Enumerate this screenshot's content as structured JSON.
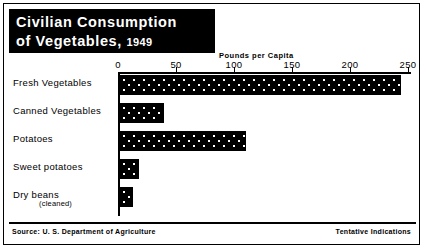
{
  "title": {
    "line1": "Civilian Consumption",
    "line2_text": "of  Vegetables,",
    "line2_year": "1949"
  },
  "footer": {
    "source": "Source: U. S. Department of Agriculture",
    "note": "Tentative Indications"
  },
  "chart_data": {
    "type": "bar",
    "orientation": "horizontal",
    "title": "Civilian Consumption of Vegetables, 1949",
    "xlabel": "Pounds per Capita",
    "ylabel": "",
    "xlim": [
      0,
      250
    ],
    "xticks": [
      0,
      50,
      100,
      150,
      200,
      250
    ],
    "xtick_labels": [
      "0",
      "50",
      "100",
      "150",
      "200",
      "250"
    ],
    "grid": false,
    "legend": false,
    "categories": [
      "Fresh Vegetables",
      "Canned Vegetables",
      "Potatoes",
      "Sweet potatoes",
      "Dry beans"
    ],
    "category_notes": [
      "",
      "",
      "",
      "",
      "(cleaned)"
    ],
    "values": [
      242,
      38,
      109,
      16,
      11
    ],
    "units": "pounds per capita",
    "bar_fill": "#000000",
    "bar_pattern": "white-dot-stipple",
    "annotations": [
      "Tentative Indications"
    ],
    "source": "U. S. Department of Agriculture"
  }
}
